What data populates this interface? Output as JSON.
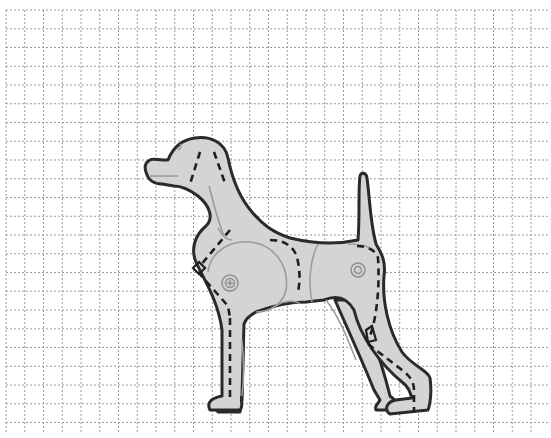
{
  "diagram": {
    "grid": {
      "origin_x": 6,
      "origin_y": 10,
      "end_x": 549,
      "end_y": 433,
      "spacing": 18.75,
      "style": "dotted",
      "color": "#9a9a9a"
    },
    "colors": {
      "background": "#ffffff",
      "body_fill": "#d4d4d4",
      "outline": "#2a2a2a",
      "dashed_lines": "#1e1e1e",
      "muscle_lines": "#9c9c9c"
    },
    "markers": [
      {
        "name": "shoulder-target",
        "cx": 230,
        "cy": 283
      },
      {
        "name": "hip-target",
        "cx": 358,
        "cy": 270
      }
    ]
  }
}
